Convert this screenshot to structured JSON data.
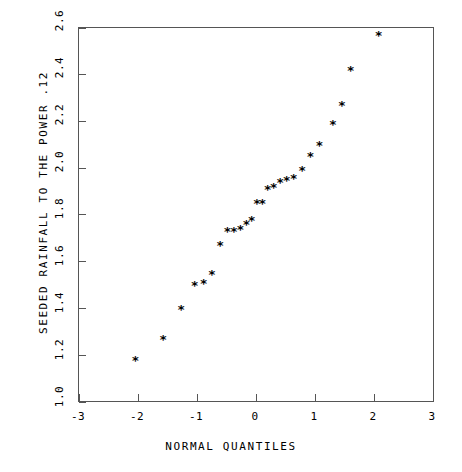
{
  "chart_data": {
    "type": "scatter",
    "title": "",
    "xlabel": "NORMAL QUANTILES",
    "ylabel": "SEEDED RAINFALL TO THE POWER .12",
    "xlim": [
      -3,
      3
    ],
    "ylim": [
      1.0,
      2.6
    ],
    "xticks": [
      -3,
      -2,
      -1,
      0,
      1,
      2,
      3
    ],
    "xtick_labels": [
      "-3",
      "-2",
      "-1",
      "0",
      "1",
      "2",
      "3"
    ],
    "yticks": [
      1.0,
      1.2,
      1.4,
      1.6,
      1.8,
      2.0,
      2.2,
      2.4,
      2.6
    ],
    "ytick_labels": [
      "1.0",
      "1.2",
      "1.4",
      "1.6",
      "1.8",
      "2.0",
      "2.2",
      "2.4",
      "2.6"
    ],
    "grid": false,
    "legend": null,
    "marker": "asterisk",
    "marker_glyph": "*",
    "marker_color": "#000000",
    "series": [
      {
        "name": "seeded rainfall quantiles",
        "n_points": 26,
        "x": [
          -2.05,
          -1.58,
          -1.28,
          -1.05,
          -0.9,
          -0.76,
          -0.62,
          -0.5,
          -0.39,
          -0.28,
          -0.18,
          -0.09,
          0.0,
          0.09,
          0.18,
          0.28,
          0.39,
          0.5,
          0.62,
          0.76,
          0.9,
          1.05,
          1.28,
          1.43,
          1.58,
          2.05
        ],
        "y": [
          1.18,
          1.27,
          1.4,
          1.5,
          1.51,
          1.55,
          1.67,
          1.73,
          1.73,
          1.74,
          1.76,
          1.78,
          1.85,
          1.85,
          1.91,
          1.92,
          1.94,
          1.95,
          1.96,
          1.99,
          2.05,
          2.1,
          2.19,
          2.27,
          2.42,
          2.57
        ]
      }
    ]
  },
  "axes": {
    "frame_color": "#555555",
    "background": "#ffffff"
  }
}
